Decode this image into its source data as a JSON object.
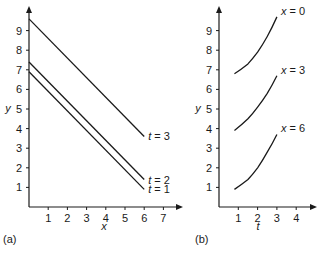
{
  "chart_data": [
    {
      "panel_label": "(a)",
      "type": "line",
      "xlabel": "x",
      "ylabel": "y",
      "xticks": [
        "1",
        "2",
        "3",
        "4",
        "5",
        "6",
        "7"
      ],
      "yticks": [
        "1",
        "2",
        "3",
        "4",
        "5",
        "6",
        "7",
        "8",
        "9"
      ],
      "xlim": [
        0,
        8
      ],
      "ylim": [
        0,
        10
      ],
      "grid": false,
      "series": [
        {
          "name": "t = 3",
          "x": [
            0,
            6
          ],
          "values": [
            9.6,
            3.6
          ]
        },
        {
          "name": "t = 2",
          "x": [
            0,
            6
          ],
          "values": [
            7.4,
            1.4
          ]
        },
        {
          "name": "t = 1",
          "x": [
            0,
            6
          ],
          "values": [
            6.9,
            0.9
          ]
        }
      ]
    },
    {
      "panel_label": "(b)",
      "type": "line",
      "xlabel": "t",
      "ylabel": "y",
      "xticks": [
        "1",
        "2",
        "3",
        "4"
      ],
      "yticks": [
        "1",
        "2",
        "3",
        "4",
        "5",
        "6",
        "7",
        "8",
        "9"
      ],
      "xlim": [
        0,
        5
      ],
      "ylim": [
        0,
        10
      ],
      "grid": false,
      "series": [
        {
          "name": "x = 0",
          "x": [
            0.8,
            1.5,
            2.0,
            2.5,
            3.0
          ],
          "values": [
            6.8,
            7.3,
            7.9,
            8.7,
            9.7
          ]
        },
        {
          "name": "x = 3",
          "x": [
            0.8,
            1.5,
            2.0,
            2.5,
            3.0
          ],
          "values": [
            3.9,
            4.5,
            5.1,
            5.8,
            6.7
          ]
        },
        {
          "name": "x = 6",
          "x": [
            0.8,
            1.5,
            2.0,
            2.5,
            3.0
          ],
          "values": [
            0.9,
            1.4,
            2.0,
            2.8,
            3.7
          ]
        }
      ]
    }
  ]
}
